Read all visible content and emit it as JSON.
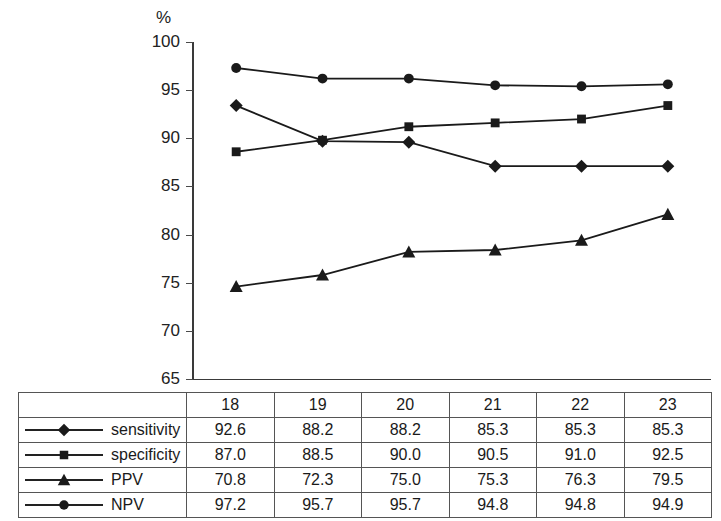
{
  "chart_data": {
    "type": "line",
    "title": "",
    "xlabel": "",
    "ylabel": "%",
    "unit_label": "%",
    "categories": [
      "18",
      "19",
      "20",
      "21",
      "22",
      "23"
    ],
    "ylim": [
      65,
      100
    ],
    "yticks": [
      65,
      70,
      75,
      80,
      85,
      90,
      95,
      100
    ],
    "ytick_labels": [
      "65",
      "70",
      "75",
      "80",
      "85",
      "90",
      "95",
      "100"
    ],
    "grid": false,
    "legend_position": "table-first-column",
    "series": [
      {
        "name": "sensitivity",
        "marker": "diamond",
        "color": "#1a1a1a",
        "values": [
          93.4,
          89.7,
          89.6,
          87.1,
          87.1,
          87.1
        ]
      },
      {
        "name": "specificity",
        "marker": "square",
        "color": "#1a1a1a",
        "values": [
          88.6,
          89.8,
          91.2,
          91.6,
          92.0,
          93.4
        ]
      },
      {
        "name": "PPV",
        "marker": "triangle",
        "color": "#1a1a1a",
        "values": [
          74.6,
          75.8,
          78.2,
          78.4,
          79.4,
          82.1
        ]
      },
      {
        "name": "NPV",
        "marker": "circle",
        "color": "#1a1a1a",
        "values": [
          97.3,
          96.2,
          96.2,
          95.5,
          95.4,
          95.6
        ]
      }
    ]
  },
  "table": {
    "column_headers": [
      "18",
      "19",
      "20",
      "21",
      "22",
      "23"
    ],
    "rows": [
      {
        "label": "sensitivity",
        "marker": "diamond",
        "values": [
          "92.6",
          "88.2",
          "88.2",
          "85.3",
          "85.3",
          "85.3"
        ]
      },
      {
        "label": "specificity",
        "marker": "square",
        "values": [
          "87.0",
          "88.5",
          "90.0",
          "90.5",
          "91.0",
          "92.5"
        ]
      },
      {
        "label": "PPV",
        "marker": "triangle",
        "values": [
          "70.8",
          "72.3",
          "75.0",
          "75.3",
          "76.3",
          "79.5"
        ]
      },
      {
        "label": "NPV",
        "marker": "circle",
        "values": [
          "97.2",
          "95.7",
          "95.7",
          "94.8",
          "94.8",
          "94.9"
        ]
      }
    ]
  }
}
